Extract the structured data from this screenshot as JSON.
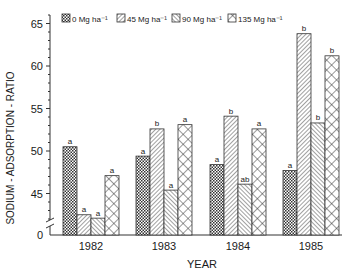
{
  "chart_data": {
    "type": "bar",
    "title": "",
    "xlabel": "YEAR",
    "ylabel": "SODIUM - ADSORPTION - RATIO",
    "categories": [
      "1982",
      "1983",
      "1984",
      "1985"
    ],
    "series": [
      {
        "name": "0 Mg ha⁻¹",
        "pattern": "dense-check",
        "values": [
          50.5,
          49.4,
          48.4,
          47.7
        ],
        "letters": [
          "a",
          "a",
          "a",
          "a"
        ]
      },
      {
        "name": "45 Mg ha⁻¹",
        "pattern": "diag-right",
        "values": [
          42.5,
          52.6,
          54.1,
          63.8
        ],
        "letters": [
          "a",
          "b",
          "b",
          "b"
        ]
      },
      {
        "name": "90 Mg ha⁻¹",
        "pattern": "diag-left",
        "values": [
          42.1,
          45.4,
          46.1,
          53.3
        ],
        "letters": [
          "a",
          "a",
          "ab",
          "b"
        ]
      },
      {
        "name": "135 Mg ha⁻¹",
        "pattern": "crosshatch",
        "values": [
          47.1,
          53.1,
          52.6,
          61.2
        ],
        "letters": [
          "a",
          "a",
          "a",
          "b"
        ]
      }
    ],
    "yticks": [
      0,
      45,
      50,
      55,
      60,
      65
    ],
    "ylim": [
      40,
      66
    ],
    "axis_break": true,
    "grid": false,
    "legend_position": "top"
  },
  "legend": [
    "0 Mg ha⁻¹",
    "45 Mg ha⁻¹",
    "90 Mg ha⁻¹",
    "135 Mg ha⁻¹"
  ]
}
